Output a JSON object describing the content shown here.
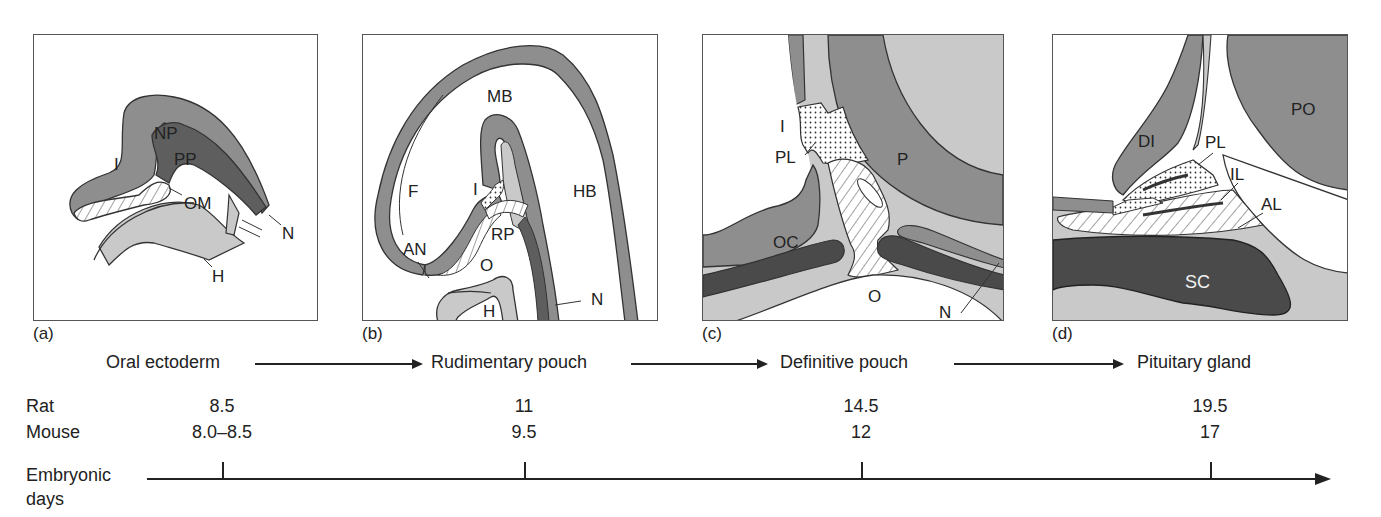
{
  "figure": {
    "colors": {
      "light_gray": "#c9c9c9",
      "mid_gray": "#8e8e8e",
      "dark_gray": "#4a4a4a",
      "outline": "#333333",
      "background": "#ffffff"
    },
    "panels": [
      {
        "id": "a",
        "caption": "(a)",
        "labels": {
          "NP": "NP",
          "PP": "PP",
          "I": "I",
          "OM": "OM",
          "N": "N",
          "H": "H"
        }
      },
      {
        "id": "b",
        "caption": "(b)",
        "labels": {
          "MB": "MB",
          "F": "F",
          "I": "I",
          "HB": "HB",
          "AN": "AN",
          "RP": "RP",
          "O": "O",
          "H": "H",
          "N": "N"
        }
      },
      {
        "id": "c",
        "caption": "(c)",
        "labels": {
          "I": "I",
          "PL": "PL",
          "P": "P",
          "OC": "OC",
          "O": "O",
          "N": "N"
        }
      },
      {
        "id": "d",
        "caption": "(d)",
        "labels": {
          "DI": "DI",
          "PL": "PL",
          "PO": "PO",
          "IL": "IL",
          "AL": "AL",
          "SC": "SC"
        }
      }
    ],
    "stages": [
      {
        "label": "Oral ectoderm"
      },
      {
        "label": "Rudimentary pouch"
      },
      {
        "label": "Definitive pouch"
      },
      {
        "label": "Pituitary gland"
      }
    ],
    "timeline": {
      "rows": [
        {
          "species": "Rat",
          "values": [
            "8.5",
            "11",
            "14.5",
            "19.5"
          ]
        },
        {
          "species": "Mouse",
          "values": [
            "8.0–8.5",
            "9.5",
            "12",
            "17"
          ]
        }
      ],
      "axis_label_line1": "Embryonic",
      "axis_label_line2": "days"
    }
  }
}
